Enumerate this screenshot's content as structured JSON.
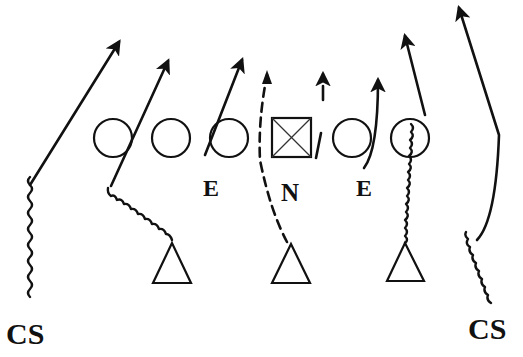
{
  "diagram": {
    "type": "football-play-diagram",
    "labels": {
      "left_end": "E",
      "nose": "N",
      "right_end": "E",
      "left_corner": "CS",
      "right_corner": "CS"
    },
    "offense": {
      "linemen_circles": 5,
      "center_symbol": "boxed-x"
    },
    "defense": {
      "triangles": 3,
      "ends": [
        "E",
        "E"
      ],
      "nose": "N",
      "corners": [
        "CS",
        "CS"
      ]
    },
    "line_styles": [
      "solid-arrow",
      "wavy-then-solid-arrow",
      "dashed-arrow"
    ]
  }
}
